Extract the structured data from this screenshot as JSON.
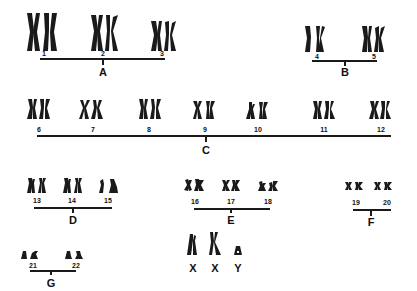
{
  "diagram": {
    "type": "karyotype",
    "colors": {
      "chromosome": "#1a1a1a",
      "background": "#ffffff"
    },
    "groups": [
      {
        "name": "A",
        "chromosomes": [
          "1",
          "2",
          "3"
        ]
      },
      {
        "name": "B",
        "chromosomes": [
          "4",
          "5"
        ]
      },
      {
        "name": "C",
        "chromosomes": [
          "6",
          "7",
          "8",
          "9",
          "10",
          "11",
          "12"
        ]
      },
      {
        "name": "D",
        "chromosomes": [
          "13",
          "14",
          "15"
        ]
      },
      {
        "name": "E",
        "chromosomes": [
          "16",
          "17",
          "18"
        ]
      },
      {
        "name": "F",
        "chromosomes": [
          "19",
          "20"
        ]
      },
      {
        "name": "G",
        "chromosomes": [
          "21",
          "22"
        ]
      }
    ],
    "sex_chromosomes": [
      "X",
      "X",
      "Y"
    ]
  }
}
